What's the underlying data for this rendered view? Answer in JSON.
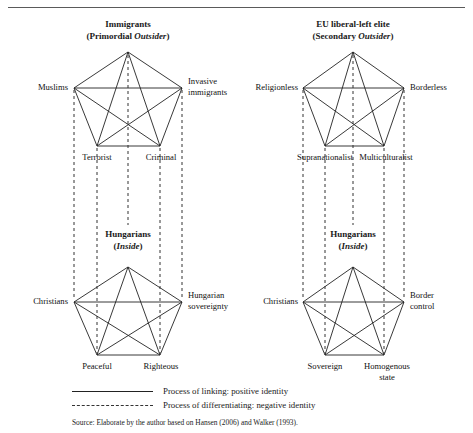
{
  "figure": {
    "top_rule": true,
    "source_note": "Source: Elaborate by the author based on Hansen (2006) and Walker (1993)."
  },
  "colors": {
    "solid_line": "#222222",
    "dashed_line": "#333333",
    "text": "#111111",
    "rule": "#5a5a5a",
    "background": "#ffffff"
  },
  "columns": [
    {
      "id": "left",
      "outsider": {
        "title": "Immigrants",
        "subtitle_prefix": "(Primordial ",
        "subtitle_italic": "Outsider",
        "subtitle_suffix": ")",
        "vertices": {
          "apex": "",
          "left": "Muslims",
          "right_line1": "Invasive",
          "right_line2": "immigrants",
          "bottom_left": "Terrorist",
          "bottom_right": "Criminal"
        }
      },
      "inside": {
        "title": "Hungarians",
        "subtitle_prefix": "(",
        "subtitle_italic": "Inside",
        "subtitle_suffix": ")",
        "vertices": {
          "left": "Christians",
          "right_line1": "Hungarian",
          "right_line2": "sovereignty",
          "bottom_left": "Peaceful",
          "bottom_right": "Righteous"
        }
      }
    },
    {
      "id": "right",
      "outsider": {
        "title": "EU liberal-left elite",
        "subtitle_prefix": "(Secondary ",
        "subtitle_italic": "Outsider",
        "subtitle_suffix": ")",
        "vertices": {
          "left": "Religionless",
          "right_line1": "Borderless",
          "right_line2": "",
          "bottom_left": "Supranationalist",
          "bottom_right": "Multiculturalist"
        }
      },
      "inside": {
        "title": "Hungarians",
        "subtitle_prefix": "(",
        "subtitle_italic": "Inside",
        "subtitle_suffix": ")",
        "vertices": {
          "left": "Christians",
          "right_line1": "Border",
          "right_line2": "control",
          "bottom_left": "Sovereign",
          "bottom_right": "Homogenous",
          "bottom_right_line2": "state"
        }
      }
    }
  ],
  "legend": [
    {
      "style": "solid",
      "label": "Process of linking: positive identity"
    },
    {
      "style": "dashed",
      "label": "Process of differentiating: negative identity"
    }
  ]
}
